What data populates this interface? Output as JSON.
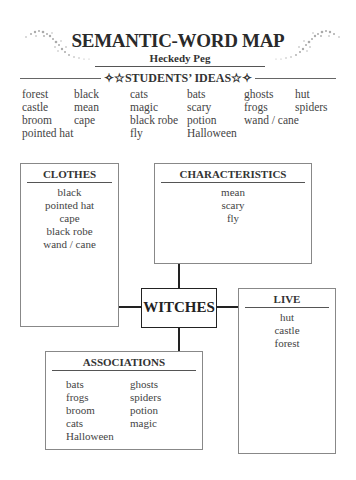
{
  "header": {
    "title": "SEMANTIC-WORD MAP",
    "subtitle": "Heckedy Peg",
    "ideas_label": "✧☆STUDENTS’ IDEAS☆✧"
  },
  "students_ideas": {
    "rows": [
      [
        "forest",
        "black",
        "cats",
        "bats",
        "ghosts",
        "hut"
      ],
      [
        "castle",
        "mean",
        "magic",
        "scary",
        "frogs",
        "spiders"
      ],
      [
        "broom",
        "cape",
        "black robe",
        "potion",
        "wand / cane",
        ""
      ],
      [
        "pointed hat",
        "",
        "fly",
        "Halloween",
        "",
        ""
      ]
    ]
  },
  "map": {
    "center": "WITCHES",
    "clothes": {
      "heading": "CLOTHES",
      "items": [
        "black",
        "pointed hat",
        "cape",
        "black robe",
        "wand / cane"
      ]
    },
    "characteristics": {
      "heading": "CHARACTERISTICS",
      "items": [
        "mean",
        "scary",
        "fly"
      ]
    },
    "live": {
      "heading": "LIVE",
      "items": [
        "hut",
        "castle",
        "forest"
      ]
    },
    "associations": {
      "heading": "ASSOCIATIONS",
      "col1": [
        "bats",
        "frogs",
        "broom",
        "cats",
        "Halloween"
      ],
      "col2": [
        "ghosts",
        "spiders",
        "potion",
        "magic"
      ]
    }
  }
}
